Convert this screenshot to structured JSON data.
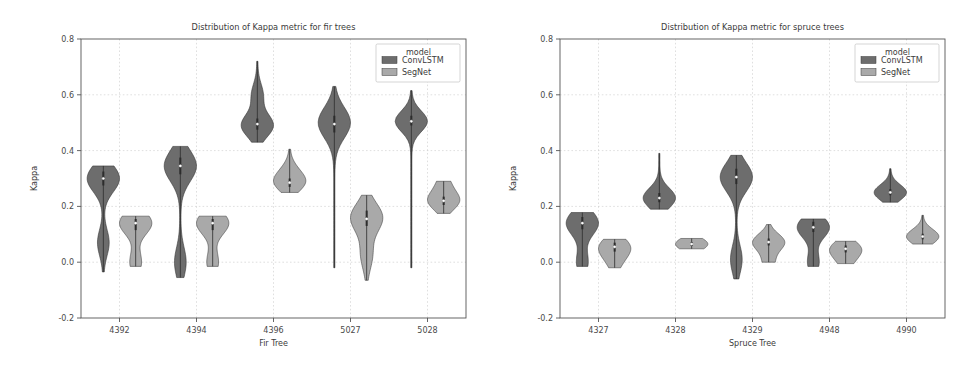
{
  "figure": {
    "width": 958,
    "height": 368,
    "background": "#ffffff",
    "panel_count": 2
  },
  "colors": {
    "convlstm": "#6d6d6d",
    "segnet": "#a9a9a9",
    "axis": "#555555",
    "grid": "#c9c9c9",
    "text": "#3b3b3b"
  },
  "legend": {
    "title": "model",
    "position": "upper right",
    "entries": [
      {
        "label": "ConvLSTM",
        "color": "#6d6d6d"
      },
      {
        "label": "SegNet",
        "color": "#a9a9a9"
      }
    ]
  },
  "chart_data": [
    {
      "type": "violin",
      "title": "Distribution of Kappa metric for fir trees",
      "xlabel": "Fir Tree",
      "ylabel": "Kappa",
      "ylim": [
        -0.2,
        0.8
      ],
      "yticks": [
        -0.2,
        0.0,
        0.2,
        0.4,
        0.6,
        0.8
      ],
      "yticklabels": [
        "-0.2",
        "0.0",
        "0.2",
        "0.4",
        "0.6",
        "0.8"
      ],
      "grid": true,
      "legend": "model",
      "categories": [
        "4392",
        "4394",
        "4396",
        "5027",
        "5028"
      ],
      "series": [
        {
          "name": "ConvLSTM",
          "color": "#6d6d6d",
          "distributions": [
            {
              "category": "4392",
              "median": 0.3,
              "q1": 0.275,
              "q3": 0.325,
              "min": -0.035,
              "max": 0.345,
              "mode": 0.3,
              "secondary_mode": 0.07
            },
            {
              "category": "4394",
              "median": 0.345,
              "q1": 0.315,
              "q3": 0.375,
              "min": -0.055,
              "max": 0.415,
              "mode": 0.345,
              "secondary_mode": 0.0
            },
            {
              "category": "4396",
              "median": 0.495,
              "q1": 0.475,
              "q3": 0.515,
              "min": 0.43,
              "max": 0.72,
              "mode": 0.49,
              "secondary_mode": 0.6
            },
            {
              "category": "5027",
              "median": 0.495,
              "q1": 0.465,
              "q3": 0.525,
              "min": -0.02,
              "max": 0.63,
              "mode": 0.5,
              "secondary_mode": null
            },
            {
              "category": "5028",
              "median": 0.505,
              "q1": 0.49,
              "q3": 0.525,
              "min": -0.02,
              "max": 0.615,
              "mode": 0.505,
              "secondary_mode": null
            }
          ]
        },
        {
          "name": "SegNet",
          "color": "#a9a9a9",
          "distributions": [
            {
              "category": "4392",
              "median": 0.14,
              "q1": 0.115,
              "q3": 0.155,
              "min": -0.015,
              "max": 0.165,
              "mode": 0.14,
              "secondary_mode": 0.0
            },
            {
              "category": "4394",
              "median": 0.14,
              "q1": 0.115,
              "q3": 0.155,
              "min": -0.015,
              "max": 0.165,
              "mode": 0.14,
              "secondary_mode": 0.0
            },
            {
              "category": "4396",
              "median": 0.285,
              "q1": 0.27,
              "q3": 0.3,
              "min": 0.25,
              "max": 0.405,
              "mode": 0.285,
              "secondary_mode": 0.33
            },
            {
              "category": "5027",
              "median": 0.155,
              "q1": 0.13,
              "q3": 0.185,
              "min": -0.065,
              "max": 0.24,
              "mode": 0.16,
              "secondary_mode": 0.025
            },
            {
              "category": "5028",
              "median": 0.22,
              "q1": 0.205,
              "q3": 0.235,
              "min": 0.175,
              "max": 0.29,
              "mode": 0.22,
              "secondary_mode": 0.285
            }
          ]
        }
      ]
    },
    {
      "type": "violin",
      "title": "Distribution of Kappa metric for spruce trees",
      "xlabel": "Spruce Tree",
      "ylabel": "Kappa",
      "ylim": [
        -0.2,
        0.8
      ],
      "yticks": [
        -0.2,
        0.0,
        0.2,
        0.4,
        0.6,
        0.8
      ],
      "yticklabels": [
        "-0.2",
        "0.0",
        "0.2",
        "0.4",
        "0.6",
        "0.8"
      ],
      "grid": true,
      "legend": "model",
      "categories": [
        "4327",
        "4328",
        "4329",
        "4948",
        "4990"
      ],
      "series": [
        {
          "name": "ConvLSTM",
          "color": "#6d6d6d",
          "distributions": [
            {
              "category": "4327",
              "median": 0.14,
              "q1": 0.118,
              "q3": 0.162,
              "min": -0.015,
              "max": 0.178,
              "mode": 0.14,
              "secondary_mode": 0.0
            },
            {
              "category": "4328",
              "median": 0.23,
              "q1": 0.215,
              "q3": 0.248,
              "min": 0.19,
              "max": 0.39,
              "mode": 0.23,
              "secondary_mode": null
            },
            {
              "category": "4329",
              "median": 0.305,
              "q1": 0.28,
              "q3": 0.335,
              "min": -0.06,
              "max": 0.383,
              "mode": 0.305,
              "secondary_mode": 0.01
            },
            {
              "category": "4948",
              "median": 0.125,
              "q1": 0.108,
              "q3": 0.145,
              "min": -0.015,
              "max": 0.155,
              "mode": 0.125,
              "secondary_mode": 0.0
            },
            {
              "category": "4990",
              "median": 0.25,
              "q1": 0.24,
              "q3": 0.262,
              "min": 0.215,
              "max": 0.335,
              "mode": 0.25,
              "secondary_mode": null
            }
          ]
        },
        {
          "name": "SegNet",
          "color": "#a9a9a9",
          "distributions": [
            {
              "category": "4327",
              "median": 0.055,
              "q1": 0.038,
              "q3": 0.07,
              "min": -0.02,
              "max": 0.082,
              "mode": 0.055,
              "secondary_mode": 0.0
            },
            {
              "category": "4328",
              "median": 0.065,
              "q1": 0.058,
              "q3": 0.072,
              "min": 0.048,
              "max": 0.085,
              "mode": 0.065,
              "secondary_mode": null
            },
            {
              "category": "4329",
              "median": 0.072,
              "q1": 0.06,
              "q3": 0.085,
              "min": 0.0,
              "max": 0.135,
              "mode": 0.072,
              "secondary_mode": 0.0
            },
            {
              "category": "4948",
              "median": 0.048,
              "q1": 0.035,
              "q3": 0.06,
              "min": -0.005,
              "max": 0.075,
              "mode": 0.048,
              "secondary_mode": 0.0
            },
            {
              "category": "4990",
              "median": 0.092,
              "q1": 0.082,
              "q3": 0.102,
              "min": 0.065,
              "max": 0.168,
              "mode": 0.092,
              "secondary_mode": null
            }
          ]
        }
      ]
    }
  ]
}
